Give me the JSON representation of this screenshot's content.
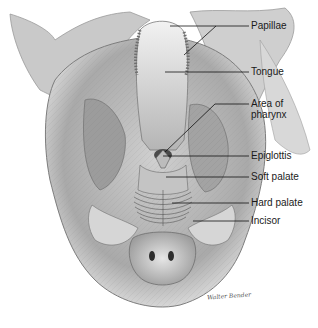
{
  "diagram": {
    "labels": [
      {
        "id": "papillae",
        "text": "Papillae",
        "x": 251,
        "y": 20
      },
      {
        "id": "tongue",
        "text": "Tongue",
        "x": 251,
        "y": 66
      },
      {
        "id": "pharynx",
        "text": "Area of\npharynx",
        "line1": "Area of",
        "line2": "pharynx",
        "x": 251,
        "y": 100
      },
      {
        "id": "epiglottis",
        "text": "Epiglottis",
        "x": 251,
        "y": 151
      },
      {
        "id": "soft_palate",
        "text": "Soft palate",
        "x": 251,
        "y": 171
      },
      {
        "id": "hard_palate",
        "text": "Hard palate",
        "x": 251,
        "y": 197
      },
      {
        "id": "incisor",
        "text": "Incisor",
        "x": 251,
        "y": 215
      }
    ],
    "signature": "Walter Bender",
    "colors": {
      "ink": "#1a1a1a",
      "background": "#ffffff",
      "shade_dark": "#6b6b6b",
      "shade_mid": "#a8a8a8",
      "shade_light": "#d9d9d9"
    }
  }
}
